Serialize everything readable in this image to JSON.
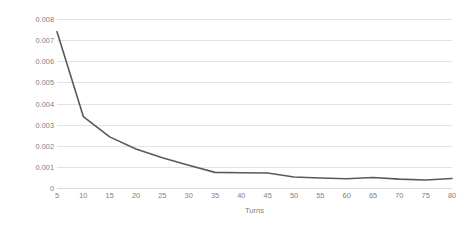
{
  "chart_data": {
    "type": "line",
    "title": "",
    "xlabel": "Turns",
    "ylabel": "ApQuatEn",
    "x": [
      5,
      10,
      15,
      20,
      25,
      30,
      35,
      40,
      45,
      50,
      55,
      60,
      65,
      70,
      75,
      80
    ],
    "values": [
      0.0074,
      0.00338,
      0.00242,
      0.00185,
      0.00143,
      0.00108,
      0.00074,
      0.00072,
      0.00071,
      0.00052,
      0.00047,
      0.00044,
      0.0005,
      0.00042,
      0.00038,
      0.00045
    ],
    "series": [
      {
        "name": "ApQuatEn",
        "values": [
          0.0074,
          0.00338,
          0.00242,
          0.00185,
          0.00143,
          0.00108,
          0.00074,
          0.00072,
          0.00071,
          0.00052,
          0.00047,
          0.00044,
          0.0005,
          0.00042,
          0.00038,
          0.00045
        ]
      }
    ],
    "xlim": [
      5,
      80
    ],
    "ylim": [
      0,
      0.008
    ],
    "xticks": [
      "5",
      "10",
      "15",
      "20",
      "25",
      "30",
      "35",
      "40",
      "45",
      "50",
      "55",
      "60",
      "65",
      "70",
      "75",
      "80"
    ],
    "yticks": [
      "0",
      "0.001",
      "0.002",
      "0.003",
      "0.004",
      "0.005",
      "0.006",
      "0.007",
      "0.008"
    ],
    "ytick_values": [
      0,
      0.001,
      0.002,
      0.003,
      0.004,
      0.005,
      0.006,
      0.007,
      0.008
    ],
    "grid": "horizontal",
    "legend": "none",
    "line_color": "#595959",
    "grid_color": "#e2e2e2",
    "tick_label_color": "#808080",
    "axis_title_color": "#7d7d7d",
    "background": "#ffffff"
  }
}
